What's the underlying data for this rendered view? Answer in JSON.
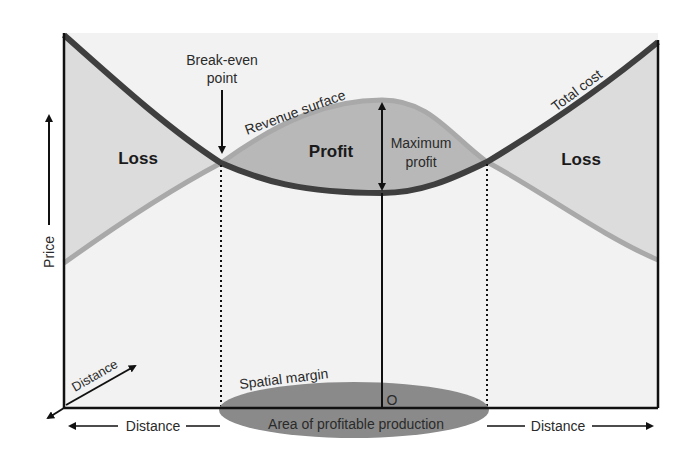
{
  "diagram": {
    "labels": {
      "break_even_line1": "Break-even",
      "break_even_line2": "point",
      "revenue_surface": "Revenue surface",
      "total_cost": "Total cost",
      "loss_left": "Loss",
      "profit": "Profit",
      "loss_right": "Loss",
      "max_profit_line1": "Maximum",
      "max_profit_line2": "profit",
      "price_axis": "Price",
      "distance_diagonal": "Distance",
      "distance_left": "Distance",
      "distance_right": "Distance",
      "spatial_margin": "Spatial margin",
      "area_profitable": "Area of profitable production",
      "origin": "O"
    },
    "colors": {
      "total_cost_line": "#3f3f3f",
      "revenue_line": "#a9a9a9",
      "loss_fill": "#dcdcdc",
      "profit_fill": "#b8b8b8",
      "plane_fill": "#f2f2f2",
      "ellipse_fill": "#8a8a8a",
      "axis": "#111111"
    }
  }
}
